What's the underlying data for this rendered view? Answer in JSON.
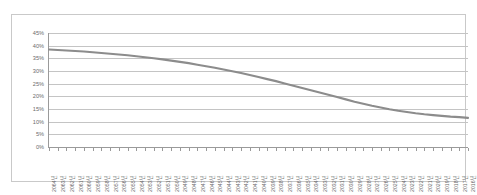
{
  "chart_data": {
    "type": "line",
    "title": "",
    "subtitle": "",
    "xlabel": "",
    "ylabel": "",
    "ylim": [
      0,
      45
    ],
    "ytick_labels": [
      "45%",
      "40%",
      "35%",
      "30%",
      "25%",
      "20%",
      "15%",
      "10%",
      "5%",
      "0%"
    ],
    "ytick_values": [
      45,
      40,
      35,
      30,
      25,
      20,
      15,
      10,
      5,
      0
    ],
    "grid": true,
    "legend": "none",
    "line_color": "#8c8c8c",
    "categories": [
      "2064년",
      "2063년",
      "2062년",
      "2061년",
      "2060년",
      "2059년",
      "2058년",
      "2057년",
      "2056년",
      "2055년",
      "2054년",
      "2053년",
      "2052년",
      "2051년",
      "2050년",
      "2049년",
      "2048년",
      "2047년",
      "2046년",
      "2045년",
      "2044년",
      "2043년",
      "2042년",
      "2041년",
      "2040년",
      "2039년",
      "2038년",
      "2037년",
      "2036년",
      "2035년",
      "2034년",
      "2033년",
      "2032년",
      "2031년",
      "2030년",
      "2029년",
      "2028년",
      "2027년",
      "2026년",
      "2025년",
      "2024년",
      "2023년",
      "2022년",
      "2021년",
      "2020년",
      "2019년",
      "2018년",
      "2017년",
      "2016년"
    ],
    "values": [
      38.5,
      38.3,
      38.1,
      37.9,
      37.7,
      37.4,
      37.1,
      36.8,
      36.5,
      36.2,
      35.8,
      35.4,
      35.0,
      34.6,
      34.1,
      33.6,
      33.1,
      32.5,
      31.9,
      31.3,
      30.6,
      29.9,
      29.2,
      28.4,
      27.6,
      26.8,
      26.0,
      25.1,
      24.2,
      23.3,
      22.4,
      21.5,
      20.6,
      19.7,
      18.8,
      17.9,
      17.1,
      16.3,
      15.6,
      14.9,
      14.3,
      13.8,
      13.3,
      12.9,
      12.6,
      12.3,
      12.0,
      11.8,
      11.5
    ]
  }
}
